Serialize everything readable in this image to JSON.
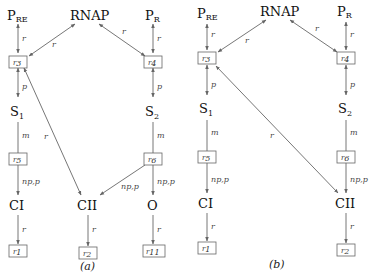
{
  "diagrams": [
    {
      "caption": "(a)",
      "nodes": {
        "pre": {
          "main": "P",
          "sub": "RE"
        },
        "rnap": "RNAP",
        "pr": {
          "main": "P",
          "sub": "R"
        },
        "s1": {
          "main": "S",
          "sub": "1"
        },
        "s2": {
          "main": "S",
          "sub": "2"
        },
        "ci": "CI",
        "cii": "CII",
        "o": "O"
      },
      "boxes": {
        "r3": {
          "main": "r",
          "sub": "3"
        },
        "r4": {
          "main": "r",
          "sub": "4"
        },
        "r5": {
          "main": "r",
          "sub": "5"
        },
        "r6": {
          "main": "r",
          "sub": "6"
        },
        "r1": {
          "main": "r",
          "sub": "1"
        },
        "r2": {
          "main": "r",
          "sub": "2"
        },
        "r11": {
          "main": "r",
          "sub": "11"
        }
      },
      "edge_labels": {
        "pre_r3": "r",
        "rnap_r3": "r",
        "rnap_r4": "r",
        "pr_r4": "r",
        "r3_s1": "p",
        "r4_s2": "p",
        "s1_r5": "m",
        "s2_r6": "m",
        "r3_cii": "r",
        "r5_ci": "np,p",
        "r6_cii": "np,p",
        "r6_o": "np,p",
        "ci_r1": "r",
        "cii_r2": "r",
        "o_r11": "r"
      }
    },
    {
      "caption": "(b)",
      "nodes": {
        "pre": {
          "main": "P",
          "sub": "RE"
        },
        "rnap": "RNAP",
        "pr": {
          "main": "P",
          "sub": "R"
        },
        "s1": {
          "main": "S",
          "sub": "1"
        },
        "s2": {
          "main": "S",
          "sub": "2"
        },
        "ci": "CI",
        "cii": "CII"
      },
      "boxes": {
        "r3": {
          "main": "r",
          "sub": "3"
        },
        "r4": {
          "main": "r",
          "sub": "4"
        },
        "r5": {
          "main": "r",
          "sub": "5"
        },
        "r6": {
          "main": "r",
          "sub": "6"
        },
        "r1": {
          "main": "r",
          "sub": "1"
        },
        "r2": {
          "main": "r",
          "sub": "2"
        }
      },
      "edge_labels": {
        "pre_r3": "r",
        "rnap_r3": "r",
        "rnap_r4": "r",
        "pr_r4": "r",
        "r3_s1": "p",
        "r4_s2": "p",
        "s1_r5": "m",
        "s2_r6": "m",
        "r3_cii": "r",
        "r5_ci": "np,p",
        "r6_cii": "np,p",
        "ci_r1": "r",
        "cii_r2": "r"
      }
    }
  ]
}
